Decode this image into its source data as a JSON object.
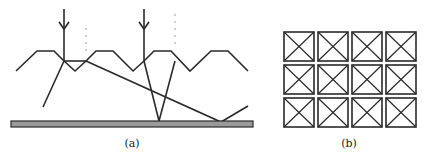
{
  "figure": {
    "panels": [
      {
        "id": "a",
        "label": "(a)",
        "description": "Light rays incident on a zigzag (trapezoidal) textured surface, refracting and reflecting off a bottom plate",
        "elements": {
          "incident_arrows": 2,
          "dotted_guides": 2,
          "surface": "trapezoidal zigzag",
          "bottom_plate_color": "#9a9a9a"
        }
      },
      {
        "id": "b",
        "label": "(b)",
        "description": "Top view: 3x4 grid of squares each with crossed diagonals (inverted pyramids)",
        "grid": {
          "rows": 3,
          "cols": 4
        }
      }
    ]
  }
}
